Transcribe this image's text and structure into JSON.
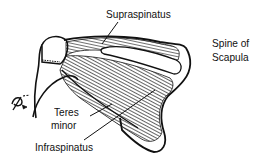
{
  "diagram": {
    "labels": {
      "supraspinatus": "Supraspinatus",
      "spine_line1": "Spine of",
      "spine_line2": "Scapula",
      "teres_line1": "Teres",
      "teres_line2": "minor",
      "infraspinatus": "Infraspinatus"
    },
    "colors": {
      "ink": "#111111",
      "background": "#ffffff"
    }
  }
}
